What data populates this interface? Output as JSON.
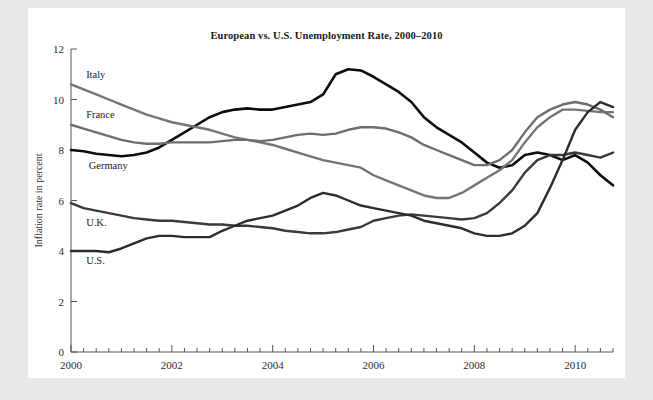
{
  "figure": {
    "background": "#e8e8e6",
    "card_background": "#ffffff"
  },
  "chart_data": {
    "type": "line",
    "title": "European vs. U.S. Unemployment Rate, 2000–2010",
    "xlabel": "",
    "ylabel": "Inflation rate in percent",
    "xlim": [
      2000,
      2010.75
    ],
    "ylim": [
      0,
      12
    ],
    "grid": false,
    "legend": "inline-labels",
    "x_tick_labels": [
      "2000",
      "2002",
      "2004",
      "2006",
      "2008",
      "2010"
    ],
    "x_tick_values": [
      2000,
      2002,
      2004,
      2006,
      2008,
      2010
    ],
    "x_minor_step": 0.25,
    "y_tick_labels": [
      "0",
      "2",
      "4",
      "6",
      "8",
      "10",
      "12"
    ],
    "y_tick_values": [
      0,
      2,
      4,
      6,
      8,
      10,
      12
    ],
    "x": [
      2000,
      2000.25,
      2000.5,
      2000.75,
      2001,
      2001.25,
      2001.5,
      2001.75,
      2002,
      2002.25,
      2002.5,
      2002.75,
      2003,
      2003.25,
      2003.5,
      2003.75,
      2004,
      2004.25,
      2004.5,
      2004.75,
      2005,
      2005.25,
      2005.5,
      2005.75,
      2006,
      2006.25,
      2006.5,
      2006.75,
      2007,
      2007.25,
      2007.5,
      2007.75,
      2008,
      2008.25,
      2008.5,
      2008.75,
      2009,
      2009.25,
      2009.5,
      2009.75,
      2010,
      2010.25,
      2010.5,
      2010.75
    ],
    "series": [
      {
        "name": "Germany",
        "color": "#0d0d0d",
        "width": 2.6,
        "label_x": 2000.35,
        "label_y": 7.25,
        "values": [
          8.0,
          7.95,
          7.85,
          7.8,
          7.75,
          7.8,
          7.9,
          8.1,
          8.4,
          8.7,
          9.0,
          9.3,
          9.5,
          9.6,
          9.65,
          9.6,
          9.6,
          9.7,
          9.8,
          9.9,
          10.2,
          11.0,
          11.2,
          11.15,
          10.9,
          10.6,
          10.3,
          9.9,
          9.3,
          8.9,
          8.6,
          8.3,
          7.9,
          7.5,
          7.3,
          7.4,
          7.8,
          7.9,
          7.8,
          7.6,
          7.8,
          7.5,
          7.0,
          6.6
        ]
      },
      {
        "name": "Italy",
        "color": "#757575",
        "width": 2.4,
        "label_x": 2000.3,
        "label_y": 10.85,
        "values": [
          10.6,
          10.4,
          10.2,
          10.0,
          9.8,
          9.6,
          9.4,
          9.25,
          9.1,
          9.0,
          8.9,
          8.8,
          8.65,
          8.5,
          8.4,
          8.3,
          8.2,
          8.05,
          7.9,
          7.75,
          7.6,
          7.5,
          7.4,
          7.3,
          7.0,
          6.8,
          6.6,
          6.4,
          6.2,
          6.1,
          6.1,
          6.3,
          6.6,
          6.9,
          7.2,
          7.6,
          8.3,
          8.9,
          9.3,
          9.6,
          9.6,
          9.55,
          9.5,
          9.5
        ]
      },
      {
        "name": "France",
        "color": "#6e6e6e",
        "width": 2.4,
        "label_x": 2000.3,
        "label_y": 9.25,
        "values": [
          9.0,
          8.85,
          8.7,
          8.55,
          8.4,
          8.3,
          8.25,
          8.25,
          8.3,
          8.3,
          8.3,
          8.3,
          8.35,
          8.4,
          8.4,
          8.35,
          8.4,
          8.5,
          8.6,
          8.65,
          8.6,
          8.65,
          8.8,
          8.9,
          8.9,
          8.85,
          8.7,
          8.5,
          8.2,
          8.0,
          7.8,
          7.6,
          7.4,
          7.4,
          7.6,
          8.0,
          8.7,
          9.3,
          9.6,
          9.8,
          9.9,
          9.8,
          9.6,
          9.3
        ]
      },
      {
        "name": "U.K.",
        "color": "#3a3a3a",
        "width": 2.4,
        "label_x": 2000.3,
        "label_y": 5.0,
        "values": [
          5.9,
          5.7,
          5.6,
          5.5,
          5.4,
          5.3,
          5.25,
          5.2,
          5.2,
          5.15,
          5.1,
          5.05,
          5.05,
          5.0,
          5.0,
          4.95,
          4.9,
          4.8,
          4.75,
          4.7,
          4.7,
          4.75,
          4.85,
          4.95,
          5.2,
          5.3,
          5.4,
          5.45,
          5.4,
          5.35,
          5.3,
          5.25,
          5.3,
          5.5,
          5.9,
          6.4,
          7.1,
          7.6,
          7.8,
          7.8,
          7.9,
          7.8,
          7.7,
          7.9
        ]
      },
      {
        "name": "U.S.",
        "color": "#2c2c2c",
        "width": 2.4,
        "label_x": 2000.3,
        "label_y": 3.5,
        "values": [
          4.0,
          4.0,
          4.0,
          3.95,
          4.1,
          4.3,
          4.5,
          4.6,
          4.6,
          4.55,
          4.55,
          4.55,
          4.8,
          5.0,
          5.2,
          5.3,
          5.4,
          5.6,
          5.8,
          6.1,
          6.3,
          6.2,
          6.0,
          5.8,
          5.7,
          5.6,
          5.5,
          5.4,
          5.2,
          5.1,
          5.0,
          4.9,
          4.7,
          4.6,
          4.6,
          4.7,
          5.0,
          5.5,
          6.5,
          7.6,
          8.8,
          9.5,
          9.9,
          9.7
        ]
      }
    ]
  }
}
